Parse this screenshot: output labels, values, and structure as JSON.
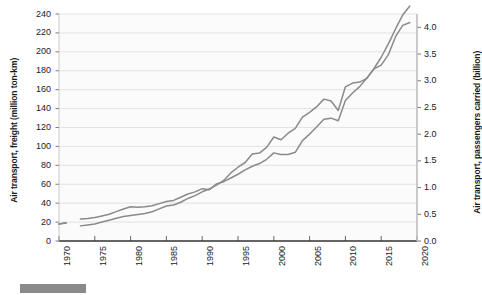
{
  "chart_data": {
    "type": "line",
    "title": "",
    "subtitle": "",
    "xlabel": "",
    "ylabel": "Air transport, freight (million ton-km)",
    "y2label": "Air transport, passengers carried (billion)",
    "grid": true,
    "legend_position": "none",
    "xlim": [
      1970,
      2020
    ],
    "ylim": [
      0,
      240
    ],
    "y2lim": [
      0.0,
      4.25
    ],
    "xticks": [
      "1970",
      "1975",
      "1980",
      "1985",
      "1990",
      "1995",
      "2000",
      "2005",
      "2010",
      "2015",
      "2020"
    ],
    "yticks": [
      "0",
      "20",
      "40",
      "60",
      "80",
      "100",
      "120",
      "140",
      "160",
      "180",
      "200",
      "220",
      "240"
    ],
    "y2ticks": [
      "0.0",
      "0.5",
      "1.0",
      "1.5",
      "2.0",
      "2.5",
      "3.0",
      "3.5",
      "4.0"
    ],
    "x": [
      1970,
      1971,
      1972,
      1973,
      1974,
      1975,
      1976,
      1977,
      1978,
      1979,
      1980,
      1981,
      1982,
      1983,
      1984,
      1985,
      1986,
      1987,
      1988,
      1989,
      1990,
      1991,
      1992,
      1993,
      1994,
      1995,
      1996,
      1997,
      1998,
      1999,
      2000,
      2001,
      2002,
      2003,
      2004,
      2005,
      2006,
      2007,
      2008,
      2009,
      2010,
      2011,
      2012,
      2013,
      2014,
      2015,
      2016,
      2017,
      2018,
      2019
    ],
    "series": [
      {
        "name": "Air transport, freight (million ton-km)",
        "axis": "left",
        "color": "#8a8a8a",
        "units": "million ton-km",
        "values": [
          18,
          19,
          null,
          16,
          17,
          18,
          20,
          22,
          24,
          26,
          27,
          28,
          29,
          31,
          34,
          37,
          38,
          41,
          45,
          48,
          52,
          55,
          59,
          64,
          72,
          78,
          83,
          92,
          93,
          99,
          110,
          107,
          114,
          119,
          131,
          136,
          142,
          150,
          148,
          138,
          163,
          167,
          168,
          172,
          182,
          186,
          197,
          216,
          228,
          231
        ]
      },
      {
        "name": "Air transport, passengers carried (billion)",
        "axis": "right",
        "color": "#8a8a8a",
        "units": "billion",
        "values": [
          0.32,
          0.34,
          null,
          0.41,
          0.42,
          0.44,
          0.47,
          0.5,
          0.55,
          0.6,
          0.64,
          0.63,
          0.64,
          0.66,
          0.7,
          0.74,
          0.76,
          0.82,
          0.88,
          0.92,
          0.98,
          0.96,
          1.07,
          1.11,
          1.18,
          1.25,
          1.33,
          1.4,
          1.45,
          1.53,
          1.65,
          1.62,
          1.62,
          1.66,
          1.88,
          2.0,
          2.14,
          2.28,
          2.3,
          2.25,
          2.63,
          2.77,
          2.89,
          3.05,
          3.23,
          3.44,
          3.69,
          3.97,
          4.23,
          4.4
        ]
      }
    ],
    "notes": {
      "crossover_year": 1991,
      "dip_years": [
        "2001",
        "2009"
      ]
    }
  },
  "axes": {
    "left_title": "Air transport, freight (million ton-km)",
    "right_title": "Air transport, passengers carried (billion)"
  },
  "footer": {
    "legend_swatch_color": "#8a8a8a",
    "legend_label": ""
  }
}
